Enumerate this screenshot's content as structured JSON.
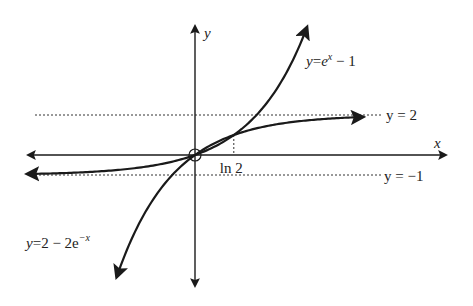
{
  "diagram": {
    "type": "function-graph",
    "axes": {
      "x_label": "x",
      "y_label": "y"
    },
    "curves": [
      {
        "id": "exp",
        "label_lhs": "y",
        "label_eq": "=",
        "label_base": "e",
        "label_sup": "x",
        "label_tail": " − 1",
        "x_range": [
          -3.0,
          2.0
        ]
      },
      {
        "id": "sat",
        "label_lhs": "y",
        "label_eq": "=",
        "label_base": "2 − 2e",
        "label_sup": "−x",
        "label_tail": "",
        "x_range": [
          -1.4,
          3.0
        ]
      }
    ],
    "asymptotes": [
      {
        "value": 2,
        "label": "y = 2"
      },
      {
        "value": -1,
        "label": "y = −1"
      }
    ],
    "marker": {
      "x": 0.693,
      "label": "ln 2"
    },
    "color": "#1a1a1a"
  }
}
